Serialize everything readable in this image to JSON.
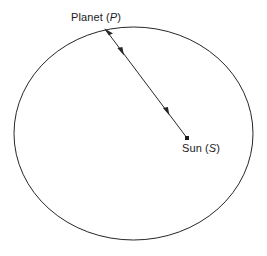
{
  "canvas": {
    "width": 267,
    "height": 256,
    "background": "#ffffff"
  },
  "style": {
    "stroke_color": "#262626",
    "stroke_width": 1,
    "text_color": "#1a1a1a",
    "font_size_px": 11
  },
  "labels": {
    "planet": {
      "prefix": "Planet (",
      "symbol": "P",
      "suffix": ")",
      "full_text": "Planet (P)",
      "x": 71,
      "y": 11
    },
    "sun": {
      "prefix": "Sun (",
      "symbol": "S",
      "suffix": ")",
      "full_text": "Sun (S)",
      "x": 182,
      "y": 142
    }
  },
  "orbit": {
    "shape": "ellipse",
    "center_x": 133.5,
    "center_y": 133.5,
    "radius_x": 119.5,
    "radius_y": 106.5,
    "filled": false
  },
  "radius_vector": {
    "from_point_label": "P",
    "to_point_label": "S",
    "start_x": 105,
    "start_y": 29,
    "end_x": 187,
    "end_y": 138,
    "arrowheads": [
      {
        "name": "arrow-to-planet",
        "x": 106,
        "y": 30,
        "direction": "up-left"
      },
      {
        "name": "arrow-to-sun-upper",
        "x": 122,
        "y": 52,
        "direction": "down-right"
      },
      {
        "name": "arrow-to-sun-lower",
        "x": 167,
        "y": 112,
        "direction": "down-right"
      }
    ]
  },
  "sun_marker": {
    "x": 187,
    "y": 138,
    "size": 4,
    "shape": "square-dot"
  }
}
